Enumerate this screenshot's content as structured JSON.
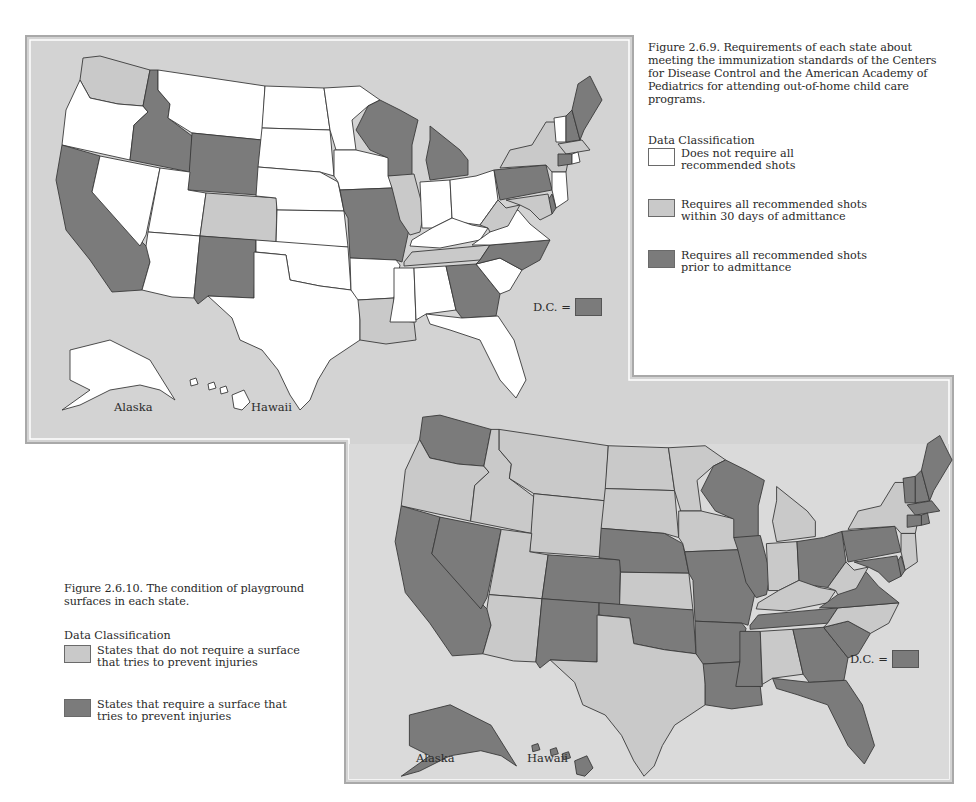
{
  "colors": {
    "frame_bg": "#d3d3d3",
    "frame_bg2": "#dbdbdb",
    "frame_border": "#a9a9a9",
    "white": "#ffffff",
    "light": "#c9c9c9",
    "dark": "#7b7b7b",
    "stroke": "#3a3a3a"
  },
  "figure1": {
    "caption": "Figure 2.6.9. Requirements of each state about meeting the immunization standards of the Centers for Disease Control and the American Academy of Pediatrics for attending out-of-home child care programs.",
    "legend_title": "Data Classification",
    "legend": [
      {
        "key": "white",
        "label": "Does not require all recommended shots"
      },
      {
        "key": "light",
        "label": "Requires all recommended shots within 30 days of admittance"
      },
      {
        "key": "dark",
        "label": "Requires all recommended shots prior to admittance"
      }
    ],
    "dc_label": "D.C. =",
    "dc_class": "dark",
    "alaska_label": "Alaska",
    "hawaii_label": "Hawaii"
  },
  "figure2": {
    "caption": "Figure 2.6.10. The condition of playground surfaces in each state.",
    "legend_title": "Data Classification",
    "legend": [
      {
        "key": "light",
        "label": "States that do not require a surface that tries to prevent injuries"
      },
      {
        "key": "dark",
        "label": "States that require a surface that tries to prevent injuries"
      }
    ],
    "dc_label": "D.C. =",
    "dc_class": "dark",
    "alaska_label": "Alaska",
    "hawaii_label": "Hawaii"
  },
  "chart_data": [
    {
      "type": "choropleth",
      "title": "Figure 2.6.9. Requirements of each state about meeting the immunization standards of the Centers for Disease Control and the American Academy of Pediatrics for attending out-of-home child care programs.",
      "classes": {
        "white": "Does not require all recommended shots",
        "light": "Requires all recommended shots within 30 days of admittance",
        "dark": "Requires all recommended shots prior to admittance"
      },
      "states": {
        "WA": "light",
        "OR": "white",
        "CA": "dark",
        "ID": "dark",
        "NV": "white",
        "MT": "white",
        "WY": "dark",
        "UT": "white",
        "AZ": "white",
        "CO": "light",
        "NM": "dark",
        "ND": "white",
        "SD": "white",
        "NE": "white",
        "KS": "white",
        "OK": "white",
        "TX": "white",
        "MN": "white",
        "IA": "white",
        "MO": "dark",
        "AR": "white",
        "LA": "light",
        "WI": "dark",
        "IL": "light",
        "MI": "dark",
        "IN": "white",
        "OH": "white",
        "KY": "white",
        "TN": "light",
        "MS": "white",
        "AL": "white",
        "GA": "dark",
        "FL": "white",
        "SC": "white",
        "NC": "dark",
        "VA": "white",
        "WV": "light",
        "PA": "dark",
        "NY": "light",
        "VT": "white",
        "NH": "dark",
        "ME": "dark",
        "MA": "light",
        "CT": "dark",
        "RI": "white",
        "NJ": "white",
        "DE": "dark",
        "MD": "light",
        "AK": "white",
        "HI": "white",
        "DC": "dark"
      }
    },
    {
      "type": "choropleth",
      "title": "Figure 2.6.10. The condition of playground surfaces in each state.",
      "classes": {
        "light": "States that do not require a surface that tries to prevent injuries",
        "dark": "States that require a surface that tries to prevent injuries"
      },
      "states": {
        "WA": "dark",
        "OR": "light",
        "CA": "dark",
        "ID": "light",
        "NV": "dark",
        "MT": "light",
        "WY": "light",
        "UT": "light",
        "AZ": "light",
        "CO": "dark",
        "NM": "dark",
        "ND": "light",
        "SD": "light",
        "NE": "dark",
        "KS": "light",
        "OK": "dark",
        "TX": "light",
        "MN": "light",
        "IA": "light",
        "MO": "dark",
        "AR": "dark",
        "LA": "dark",
        "WI": "dark",
        "IL": "dark",
        "MI": "light",
        "IN": "light",
        "OH": "dark",
        "KY": "light",
        "TN": "dark",
        "MS": "dark",
        "AL": "light",
        "GA": "dark",
        "FL": "dark",
        "SC": "dark",
        "NC": "light",
        "VA": "dark",
        "WV": "light",
        "PA": "dark",
        "NY": "light",
        "VT": "dark",
        "NH": "dark",
        "ME": "dark",
        "MA": "dark",
        "CT": "dark",
        "RI": "dark",
        "NJ": "light",
        "DE": "dark",
        "MD": "dark",
        "AK": "dark",
        "HI": "dark",
        "DC": "dark"
      }
    }
  ]
}
